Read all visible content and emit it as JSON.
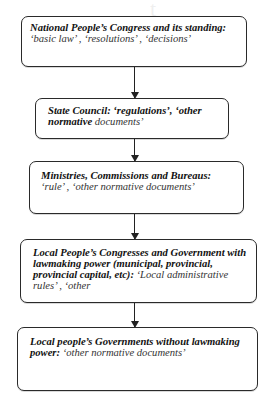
{
  "diagram": {
    "type": "hierarchy-flowchart",
    "direction": "top-to-bottom",
    "nodes": [
      {
        "id": "npc",
        "bold": "National People’s Congress and its standing:",
        "italic": " ‘basic law’ , ‘resolutions’ , ‘decisions’"
      },
      {
        "id": "state-council",
        "bold": "State Council: ‘regulations’, ‘other normative",
        "italic": " documents’"
      },
      {
        "id": "ministries",
        "bold": "Ministries, Commissions and Bureaus:",
        "italic": " ‘rule’ , ‘other normative documents’"
      },
      {
        "id": "local-congresses",
        "bold": "Local People’s Congresses and Government with lawmaking power (municipal, provincial, provincial capital, etc):",
        "italic": " ‘Local administrative rules’ , ‘other"
      },
      {
        "id": "local-governments",
        "bold": "Local people’s Governments without lawmaking power:",
        "italic": " ‘other normative documents’"
      }
    ],
    "edges": [
      {
        "from": "npc",
        "to": "state-council"
      },
      {
        "from": "state-council",
        "to": "ministries"
      },
      {
        "from": "ministries",
        "to": "local-congresses"
      },
      {
        "from": "local-congresses",
        "to": "local-governments"
      }
    ]
  },
  "colors": {
    "border": "#2a2a2a",
    "text_bold": "#111111",
    "text_italic": "#333333",
    "background": "#ffffff"
  }
}
